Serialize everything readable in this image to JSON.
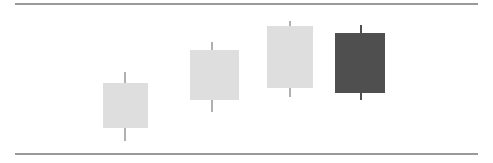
{
  "chart_data": {
    "type": "candlestick",
    "title": "",
    "xlabel": "",
    "ylabel": "",
    "grid": false,
    "legend": false,
    "axis_rules": {
      "top_y": 3,
      "bottom_y": 153,
      "x_start": 15,
      "x_end": 478,
      "color": "#9a9a9a"
    },
    "colors": {
      "up_body": "#dedede",
      "down_body": "#4f4f4f",
      "up_wick": "#b0b0b0",
      "down_wick": "#4f4f4f",
      "background": "#ffffff"
    },
    "note": "Pixel coordinates are measured from the top-left of the 493x163 figure; smaller y = higher price.",
    "categories": [
      "1",
      "2",
      "3",
      "4"
    ],
    "candles": [
      {
        "index": 1,
        "direction": "up",
        "color": "#dedede",
        "wick_color": "#b0b0b0",
        "center_x": 125,
        "body_left": 103,
        "body_right": 148,
        "body_top_y": 83,
        "body_bottom_y": 128,
        "wick_top_y": 72,
        "wick_bottom_y": 141
      },
      {
        "index": 2,
        "direction": "up",
        "color": "#dedede",
        "wick_color": "#b0b0b0",
        "center_x": 212,
        "body_left": 190,
        "body_right": 239,
        "body_top_y": 50,
        "body_bottom_y": 100,
        "wick_top_y": 42,
        "wick_bottom_y": 112
      },
      {
        "index": 3,
        "direction": "up",
        "color": "#dedede",
        "wick_color": "#b0b0b0",
        "center_x": 290,
        "body_left": 267,
        "body_right": 313,
        "body_top_y": 26,
        "body_bottom_y": 88,
        "wick_top_y": 21,
        "wick_bottom_y": 97
      },
      {
        "index": 4,
        "direction": "down",
        "color": "#4f4f4f",
        "wick_color": "#4f4f4f",
        "center_x": 361,
        "body_left": 335,
        "body_right": 385,
        "body_top_y": 33,
        "body_bottom_y": 93,
        "wick_top_y": 25,
        "wick_bottom_y": 100
      }
    ]
  }
}
